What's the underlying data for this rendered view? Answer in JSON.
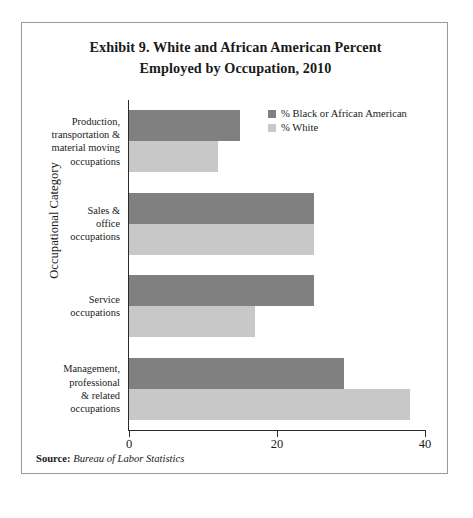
{
  "title": {
    "line1": "Exhibit 9. White and African American Percent",
    "line2": "Employed by Occupation, 2010"
  },
  "legend": {
    "items": [
      {
        "label": "% Black or African American",
        "color": "#808080",
        "swatch": "legend-swatch-dark"
      },
      {
        "label": "% White",
        "color": "#c8c8c8",
        "swatch": "legend-swatch-light"
      }
    ]
  },
  "axes": {
    "y_title": "Occupational Category",
    "x_ticks": [
      "0",
      "20",
      "40"
    ]
  },
  "categories": [
    {
      "lines": [
        "Production,",
        "transportation &",
        "material moving",
        "occupations"
      ]
    },
    {
      "lines": [
        "Sales &",
        "office",
        "occupations"
      ]
    },
    {
      "lines": [
        "Service",
        "occupations"
      ]
    },
    {
      "lines": [
        "Management,",
        "professional",
        "& related",
        "occupations"
      ]
    }
  ],
  "source": {
    "label": "Source:",
    "value": "Bureau of Labor Statistics"
  },
  "chart_data": {
    "type": "bar",
    "orientation": "horizontal",
    "title": "Exhibit 9. White and African American Percent Employed by Occupation, 2010",
    "xlabel": "",
    "ylabel": "Occupational Category",
    "xlim": [
      0,
      40
    ],
    "xticks": [
      0,
      20,
      40
    ],
    "grid": false,
    "legend_position": "top-right",
    "categories": [
      "Production, transportation & material moving occupations",
      "Sales & office occupations",
      "Service occupations",
      "Management, professional & related occupations"
    ],
    "series": [
      {
        "name": "% Black or African American",
        "color": "#808080",
        "values": [
          15,
          25,
          25,
          29
        ]
      },
      {
        "name": "% White",
        "color": "#c8c8c8",
        "values": [
          12,
          25,
          17,
          38
        ]
      }
    ],
    "source": "Bureau of Labor Statistics"
  }
}
